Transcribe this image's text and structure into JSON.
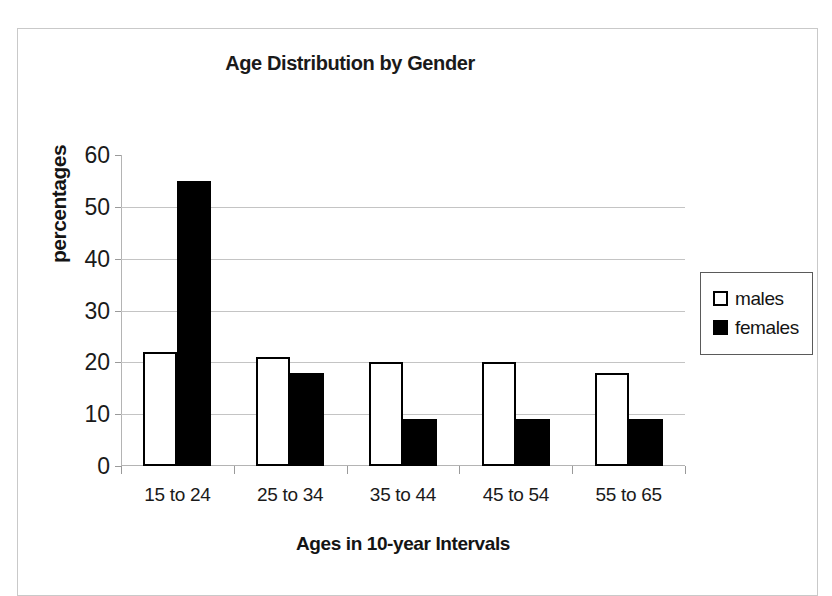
{
  "chart_data": {
    "type": "bar",
    "title": "Age Distribution by Gender",
    "xlabel": "Ages in 10-year Intervals",
    "ylabel": "percentages",
    "categories": [
      "15 to 24",
      "25 to 34",
      "35 to 44",
      "45 to 54",
      "55 to 65"
    ],
    "series": [
      {
        "name": "males",
        "values": [
          22,
          21,
          20,
          20,
          18
        ],
        "color": "#ffffff",
        "border": "#000000"
      },
      {
        "name": "females",
        "values": [
          55,
          18,
          9,
          9,
          9
        ],
        "color": "#000000",
        "border": "#000000"
      }
    ],
    "ylim": [
      0,
      60
    ],
    "yticks": [
      0,
      10,
      20,
      30,
      40,
      50,
      60
    ],
    "ytick_labels": [
      "0",
      "10",
      "20",
      "30",
      "40",
      "50",
      "60"
    ],
    "grid": true,
    "legend_position": "right"
  },
  "legend": {
    "items": [
      {
        "label": "males"
      },
      {
        "label": "females"
      }
    ]
  }
}
